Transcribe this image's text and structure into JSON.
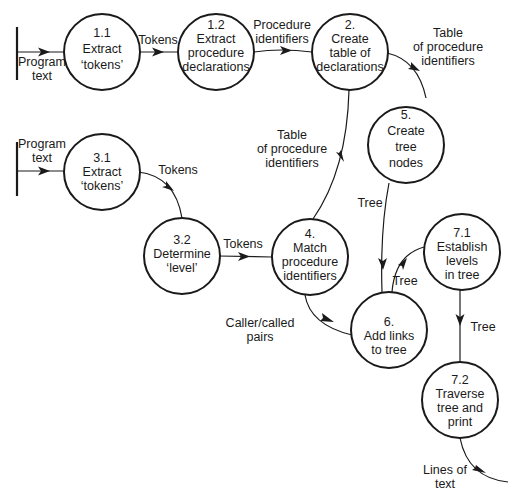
{
  "diagram": {
    "type": "data-flow-diagram",
    "nodes": [
      {
        "id": "1.1",
        "lines": [
          "1.1",
          "Extract",
          "‘tokens’"
        ]
      },
      {
        "id": "1.2",
        "lines": [
          "1.2",
          "Extract",
          "procedure",
          "declarations"
        ]
      },
      {
        "id": "2",
        "lines": [
          "2.",
          "Create",
          "table of",
          "declarations"
        ]
      },
      {
        "id": "5",
        "lines": [
          "5.",
          "Create",
          "tree",
          "nodes"
        ]
      },
      {
        "id": "3.1",
        "lines": [
          "3.1",
          "Extract",
          "‘tokens’"
        ]
      },
      {
        "id": "3.2",
        "lines": [
          "3.2",
          "Determine",
          "‘level’"
        ]
      },
      {
        "id": "4",
        "lines": [
          "4.",
          "Match",
          "procedure",
          "identifiers"
        ]
      },
      {
        "id": "6",
        "lines": [
          "6.",
          "Add links",
          "to tree"
        ]
      },
      {
        "id": "7.1",
        "lines": [
          "7.1",
          "Establish",
          "levels",
          "in tree"
        ]
      },
      {
        "id": "7.2",
        "lines": [
          "7.2",
          "Traverse",
          "tree and",
          "print"
        ]
      }
    ],
    "flows": [
      {
        "from": "source-1",
        "to": "1.1",
        "label": [
          "Program",
          "text"
        ]
      },
      {
        "from": "1.1",
        "to": "1.2",
        "label": [
          "Tokens"
        ]
      },
      {
        "from": "1.2",
        "to": "2",
        "label": [
          "Procedure",
          "identifiers"
        ]
      },
      {
        "from": "2",
        "to": "5",
        "label": [
          "Table",
          "of procedure",
          "identifiers"
        ]
      },
      {
        "from": "2",
        "to": "4",
        "label": [
          "Table",
          "of procedure",
          "identifiers"
        ]
      },
      {
        "from": "source-2",
        "to": "3.1",
        "label": [
          "Program",
          "text"
        ]
      },
      {
        "from": "3.1",
        "to": "3.2",
        "label": [
          "Tokens"
        ]
      },
      {
        "from": "3.2",
        "to": "4",
        "label": [
          "Tokens"
        ]
      },
      {
        "from": "5",
        "to": "6",
        "label": [
          "Tree"
        ]
      },
      {
        "from": "4",
        "to": "6",
        "label": [
          "Caller/called",
          "pairs"
        ]
      },
      {
        "from": "6",
        "to": "7.1",
        "label": [
          "Tree"
        ]
      },
      {
        "from": "7.1",
        "to": "7.2",
        "label": [
          "Tree"
        ]
      },
      {
        "from": "7.2",
        "to": "sink",
        "label": [
          "Lines of",
          "text"
        ]
      }
    ]
  },
  "n11": {
    "a": "1.1",
    "b": "Extract",
    "c": "‘tokens’"
  },
  "n12": {
    "a": "1.2",
    "b": "Extract",
    "c": "procedure",
    "d": "declarations"
  },
  "n2": {
    "a": "2.",
    "b": "Create",
    "c": "table of",
    "d": "declarations"
  },
  "n5": {
    "a": "5.",
    "b": "Create",
    "c": "tree",
    "d": "nodes"
  },
  "n31": {
    "a": "3.1",
    "b": "Extract",
    "c": "‘tokens’"
  },
  "n32": {
    "a": "3.2",
    "b": "Determine",
    "c": "‘level’"
  },
  "n4": {
    "a": "4.",
    "b": "Match",
    "c": "procedure",
    "d": "identifiers"
  },
  "n6": {
    "a": "6.",
    "b": "Add links",
    "c": "to tree"
  },
  "n71": {
    "a": "7.1",
    "b": "Establish",
    "c": "levels",
    "d": "in tree"
  },
  "n72": {
    "a": "7.2",
    "b": "Traverse",
    "c": "tree and",
    "d": "print"
  },
  "labels": {
    "prog1_a": "Program",
    "prog1_b": "text",
    "tok1": "Tokens",
    "procid_a": "Procedure",
    "procid_b": "identifiers",
    "tab1_a": "Table",
    "tab1_b": "of procedure",
    "tab1_c": "identifiers",
    "tab2_a": "Table",
    "tab2_b": "of procedure",
    "tab2_c": "identifiers",
    "prog2_a": "Program",
    "prog2_b": "text",
    "tok2": "Tokens",
    "tok3": "Tokens",
    "tree1": "Tree",
    "caller_a": "Caller/called",
    "caller_b": "pairs",
    "tree2": "Tree",
    "tree3": "Tree",
    "lines_a": "Lines of",
    "lines_b": "text"
  }
}
